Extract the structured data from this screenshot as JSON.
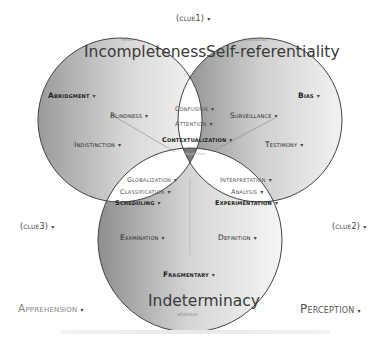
{
  "diagram": {
    "type": "venn",
    "sets": [
      {
        "id": "left",
        "title": "Incompleteness",
        "subtitle": "effort",
        "items": [
          "Abridgment",
          "Blindness",
          "Indistinction"
        ]
      },
      {
        "id": "right",
        "title": "Self-referentiality",
        "subtitle": "motivation",
        "items": [
          "Bias",
          "Surveillance",
          "Testimony"
        ]
      },
      {
        "id": "bottom",
        "title": "Indeterminacy",
        "subtitle": "attention",
        "items": [
          "Examination",
          "Definition",
          "Fragmentary"
        ]
      }
    ],
    "intersections": {
      "left_right": [
        "Confusion",
        "Attention",
        "Contextualization"
      ],
      "left_bottom": [
        "Globalization",
        "Classification",
        "Scheduling"
      ],
      "right_bottom": [
        "Interpretation",
        "Analysis",
        "Experimentation"
      ],
      "center": "illegible text"
    },
    "clues": {
      "clue1": "(clue1)",
      "clue2": "(clue2)",
      "clue3": "(clue3)"
    },
    "outer_labels": {
      "left": "Apprehension",
      "right": "Perception"
    },
    "dropdown_arrow": "▾"
  }
}
